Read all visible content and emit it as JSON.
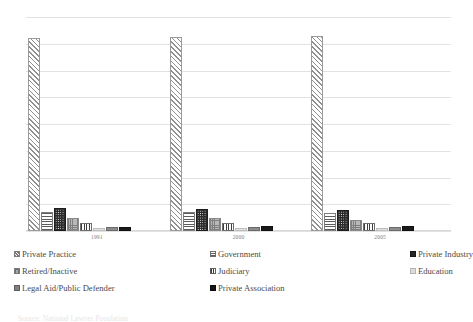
{
  "chart_data": {
    "type": "bar",
    "title": "",
    "xlabel": "",
    "ylabel": "",
    "categories": [
      "1991",
      "2000",
      "2005"
    ],
    "ylim": [
      0,
      80
    ],
    "ytick_labels": [
      "80%",
      "70%",
      "60%",
      "50%",
      "40%",
      "30%",
      "20%",
      "10%",
      "0%"
    ],
    "ytick_values": [
      80,
      70,
      60,
      50,
      40,
      30,
      20,
      10,
      0
    ],
    "grid": true,
    "legend_position": "bottom",
    "value_suffix": "%",
    "series": [
      {
        "name": "Private Practice",
        "pattern": "diagonal-hatch",
        "values": [
          72.0,
          72.5,
          73.0
        ]
      },
      {
        "name": "Government",
        "pattern": "horizontal-lines",
        "values": [
          7.0,
          7.2,
          6.6
        ]
      },
      {
        "name": "Private Industry",
        "pattern": "dark-dotted",
        "values": [
          8.6,
          8.2,
          8.0
        ]
      },
      {
        "name": "Retired/Inactive",
        "pattern": "gray-checkered",
        "values": [
          5.0,
          4.8,
          4.3
        ]
      },
      {
        "name": "Judiciary",
        "pattern": "vertical-lines",
        "values": [
          3.0,
          3.0,
          3.0
        ]
      },
      {
        "name": "Education",
        "pattern": "light-gray-solid",
        "values": [
          1.2,
          1.2,
          1.2
        ]
      },
      {
        "name": "Legal Aid/Public Defender",
        "pattern": "mid-gray-solid",
        "values": [
          1.4,
          1.4,
          1.4
        ]
      },
      {
        "name": "Private Association",
        "pattern": "near-black-solid",
        "values": [
          1.6,
          1.7,
          1.8
        ]
      }
    ]
  },
  "legend": {
    "items": [
      {
        "label": "Private Practice",
        "swatch": "s-diag"
      },
      {
        "label": "Government",
        "swatch": "s-horiz"
      },
      {
        "label": "Private Industry",
        "swatch": "s-dots"
      },
      {
        "label": "Retired/Inactive",
        "swatch": "s-check"
      },
      {
        "label": "Judiciary",
        "swatch": "s-vert"
      },
      {
        "label": "Education",
        "swatch": "s-light"
      },
      {
        "label": "Legal Aid/Public Defender",
        "swatch": "s-mid"
      },
      {
        "label": "Private Association",
        "swatch": "s-dark"
      }
    ]
  },
  "footer": {
    "cut_off_text": "Source: National Lawyer Population"
  }
}
